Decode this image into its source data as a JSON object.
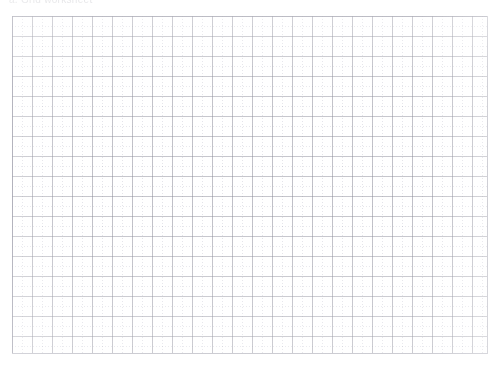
{
  "page": {
    "width": 502,
    "height": 372,
    "background_color": "#ffffff"
  },
  "header": {
    "text": "a. Grid worksheet",
    "note": "line of text clipped by the top edge of the scan, only lower pixels visible"
  },
  "grid": {
    "label": "graph-paper-grid",
    "left": 12,
    "top": 16,
    "width": 475,
    "height": 337,
    "cell_size_px": 20,
    "columns": 24,
    "rows": 17,
    "major_line_color": "#82828f",
    "minor_line_color": "#7878a0",
    "minor_line_style": "dotted",
    "frame": true,
    "cells_filled": 0,
    "content": ""
  }
}
